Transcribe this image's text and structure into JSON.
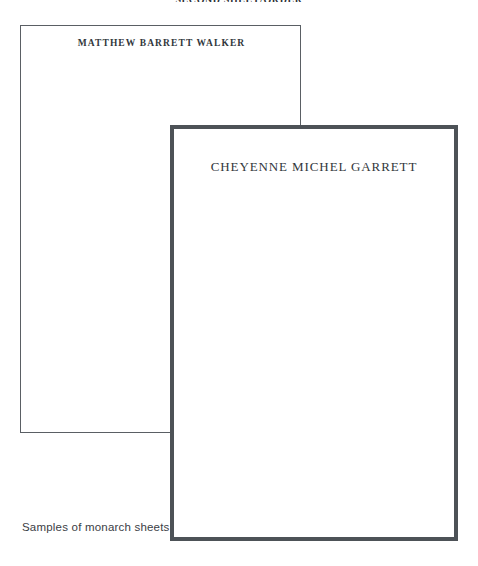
{
  "page": {
    "top_heading": "SECOND SHEET/ORDER",
    "caption": "Samples of monarch sheets"
  },
  "sheets": [
    {
      "id": "back-sheet",
      "name_line": "MATTHEW BARRETT WALKER"
    },
    {
      "id": "front-sheet",
      "name_line": "CHEYENNE MICHEL GARRETT"
    }
  ],
  "colors": {
    "page_background": "#ffffff",
    "sheet_border_thin": "#5a5f64",
    "sheet_border_thick": "#4d5257",
    "text": "#32373c",
    "caption_text": "#3b4045"
  }
}
